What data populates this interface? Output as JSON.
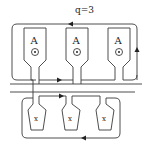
{
  "diagram": {
    "parameter_label": "q=3",
    "top_group": {
      "poles": [
        {
          "label": "A",
          "symbol": "current-out-dot"
        },
        {
          "label": "A",
          "symbol": "current-out-dot"
        },
        {
          "label": "A",
          "symbol": "current-out-dot"
        }
      ]
    },
    "bottom_group": {
      "poles": [
        {
          "label": "x"
        },
        {
          "label": "x"
        },
        {
          "label": "x"
        }
      ]
    },
    "colors": {
      "stroke": "#3a3a3a",
      "background": "#ffffff"
    }
  }
}
